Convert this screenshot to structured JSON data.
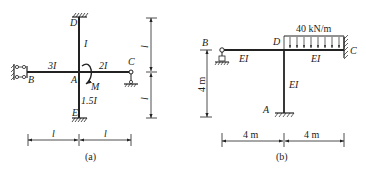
{
  "figure_a": {
    "caption": "(a)",
    "nodes": {
      "A": "A",
      "B": "B",
      "C": "C",
      "D": "D",
      "E": "E"
    },
    "members": {
      "AD": "I",
      "AB": "3I",
      "AC": "2I",
      "AE": "1.5I"
    },
    "moment_label": "M",
    "dimensions": {
      "horizontal_left": "l",
      "horizontal_right": "l",
      "vertical_top": "l",
      "vertical_bottom": "l"
    },
    "supports": {
      "B": "guided-roller (double link)",
      "C": "roller",
      "D": "fixed",
      "E": "fixed"
    }
  },
  "figure_b": {
    "caption": "(b)",
    "nodes": {
      "A": "A",
      "B": "B",
      "C": "C",
      "D": "D"
    },
    "members": {
      "BD": "EI",
      "DC": "EI",
      "DA": "EI"
    },
    "load_label": "40 kN/m",
    "dimensions": {
      "horizontal_left": "4 m",
      "horizontal_right": "4 m",
      "vertical": "4 m"
    },
    "supports": {
      "A": "fixed",
      "B": "pin",
      "C": "fixed"
    }
  }
}
